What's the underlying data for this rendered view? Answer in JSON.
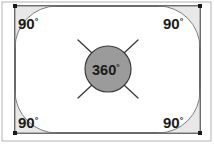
{
  "figure": {
    "canvas": {
      "width": 214,
      "height": 144
    },
    "outer_frame": {
      "x": 2,
      "y": 2,
      "width": 209,
      "height": 139,
      "stroke": "#b3b3b3"
    },
    "rectangle": {
      "x": 15,
      "y": 6,
      "width": 185,
      "height": 127,
      "stroke": "#2b2b2b",
      "fill": "#ffffff"
    },
    "vertex_dots": [
      {
        "name": "top-left",
        "cx": 15,
        "cy": 6
      },
      {
        "name": "top-right",
        "cx": 200,
        "cy": 6
      },
      {
        "name": "bottom-left",
        "cx": 15,
        "cy": 133
      },
      {
        "name": "bottom-right",
        "cx": 200,
        "cy": 133
      }
    ],
    "vertex_dot_color": "#1a1a1a",
    "corner_arc_radius": 42,
    "corner_arc_fill": "#e8e8e8",
    "corner_arc_stroke": "#707070",
    "corners": [
      {
        "id": "top-left",
        "label": "90",
        "degree_symbol": "°",
        "label_x": 18,
        "label_y": 29,
        "path": "M 15 48 A 42 42 0 0 1 57 6 L 15 6 Z"
      },
      {
        "id": "top-right",
        "label": "90",
        "degree_symbol": "°",
        "label_x": 163,
        "label_y": 29,
        "path": "M 158 6 A 42 42 0 0 1 200 48 L 200 6 Z"
      },
      {
        "id": "bottom-left",
        "label": "90",
        "degree_symbol": "°",
        "label_x": 18,
        "label_y": 128,
        "path": "M 57 133 A 42 42 0 0 1 15 91 L 15 133 Z"
      },
      {
        "id": "bottom-right",
        "label": "90",
        "degree_symbol": "°",
        "label_x": 163,
        "label_y": 128,
        "path": "M 200 91 A 42 42 0 0 1 158 133 L 200 133 Z"
      }
    ],
    "center_circle": {
      "cx": 108,
      "cy": 69,
      "r": 23,
      "fill": "#9b9b9b",
      "stroke": "#3a3a3a",
      "label": "360",
      "degree_symbol": "°",
      "label_x": 92,
      "label_y": 75
    },
    "ticks": [
      {
        "id": "tick-upper-left",
        "x1": 78,
        "y1": 40,
        "x2": 92,
        "y2": 53
      },
      {
        "id": "tick-upper-right",
        "x1": 138,
        "y1": 40,
        "x2": 124,
        "y2": 53
      },
      {
        "id": "tick-lower-left",
        "x1": 78,
        "y1": 98,
        "x2": 92,
        "y2": 85
      },
      {
        "id": "tick-lower-right",
        "x1": 138,
        "y1": 98,
        "x2": 124,
        "y2": 85
      }
    ],
    "tick_stroke": "#3a3a3a"
  }
}
